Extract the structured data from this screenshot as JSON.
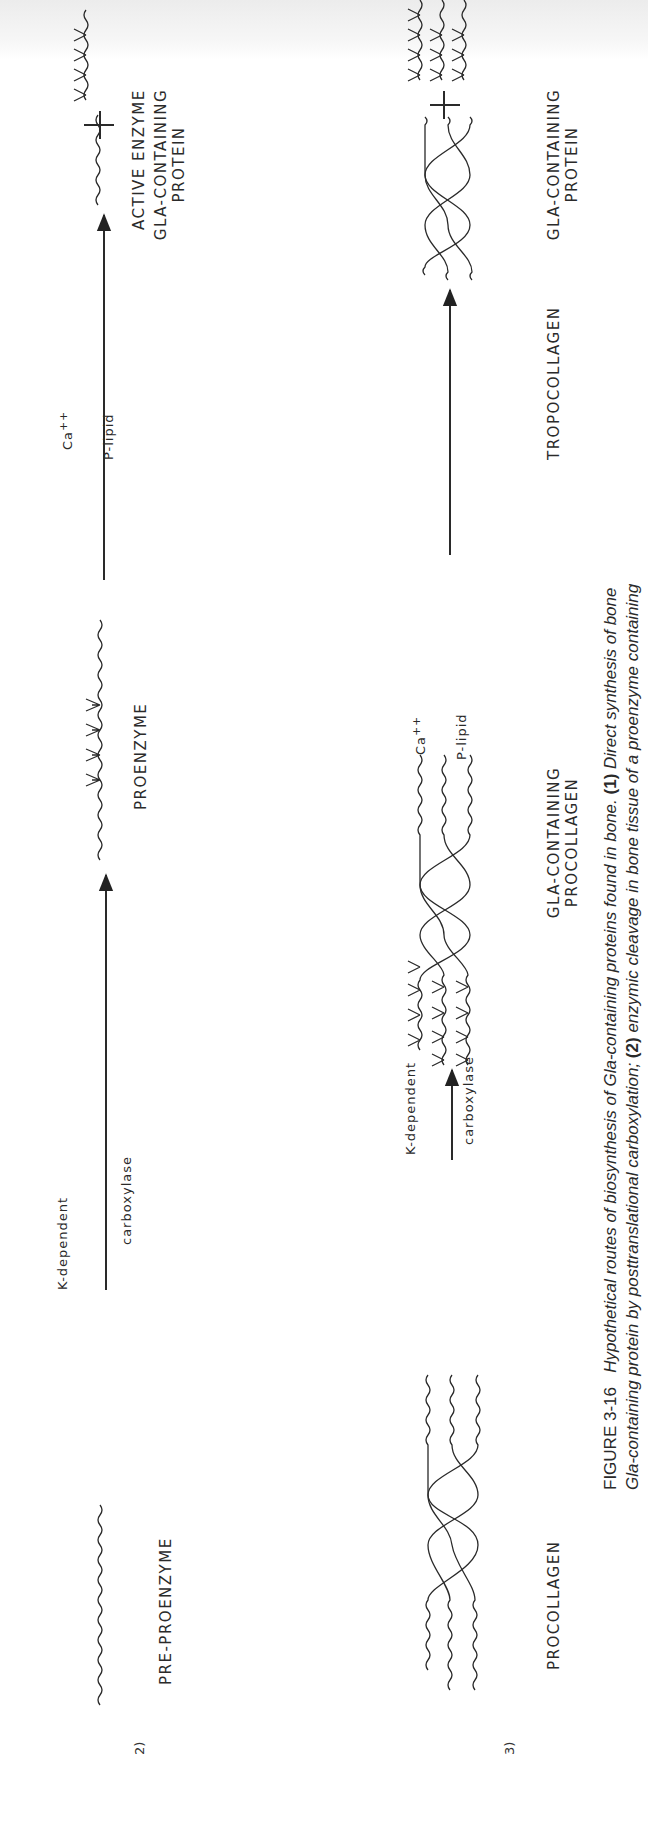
{
  "figure": {
    "number": "FIGURE 3-16",
    "caption_line1_title": "Hypothetical routes of biosynthesis of Gla-containing proteins found in bone.",
    "caption_line1_part1_num": "(1)",
    "caption_line1_part1_text": "Direct synthesis of bone",
    "caption_line2_text_a": "Gla-containing protein by posttranslational carboxylation;",
    "caption_line2_part2_num": "(2)",
    "caption_line2_text_b": "enzymic cleavage in bone tissue of a proenzyme containing"
  },
  "route2": {
    "number": "2)",
    "start_label": "PRE-PROENZYME",
    "step1_above": "K-dependent",
    "step1_below": "carboxylase",
    "intermediate_label": "PROENZYME",
    "step2_above": "Ca",
    "step2_above_sup": "++",
    "step2_below": "P-lipid",
    "product1_label": "ACTIVE  ENZYME",
    "plus": "+",
    "product2_label_line1": "GLA-CONTAINING",
    "product2_label_line2": "PROTEIN"
  },
  "route3": {
    "number": "3)",
    "start_label": "PROCOLLAGEN",
    "step1_above": "K-dependent",
    "step1_below": "carboxylase",
    "intermediate_label_line1": "GLA-CONTAINING",
    "intermediate_label_line2": "PROCOLLAGEN",
    "step2_above": "Ca",
    "step2_above_sup": "++",
    "step2_below": "P-lipid",
    "product1_label": "TROPOCOLLAGEN",
    "plus": "+",
    "product2_label_line1": "GLA-CONTAINING",
    "product2_label_line2": "PROTEIN"
  },
  "colors": {
    "ink": "#2a2a2a",
    "background": "#ffffff",
    "topband": "#ececec"
  }
}
